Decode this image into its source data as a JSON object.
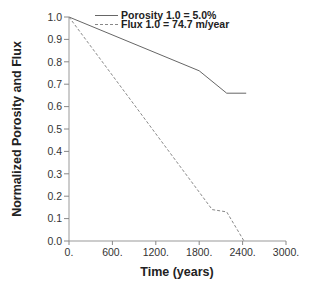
{
  "chart_data": {
    "type": "line",
    "title": "",
    "xlabel": "Time (years)",
    "ylabel": "Normalized Porosity and Flux",
    "xlim": [
      0,
      3000
    ],
    "ylim": [
      0.0,
      1.0
    ],
    "x_ticks": [
      "0.",
      "600.",
      "1200.",
      "1800.",
      "2400.",
      "3000."
    ],
    "y_ticks": [
      "0.0",
      "0.1",
      "0.2",
      "0.3",
      "0.4",
      "0.5",
      "0.6",
      "0.7",
      "0.8",
      "0.9",
      "1.0"
    ],
    "grid": false,
    "legend_position": "upper right",
    "series": [
      {
        "name": "Porosity 1.0 = 5.0%",
        "style": "solid",
        "x": [
          0,
          1800,
          2180,
          2450
        ],
        "y": [
          1.0,
          0.76,
          0.66,
          0.66
        ]
      },
      {
        "name": "Flux 1.0 = 74.7 m/year",
        "style": "dashed",
        "x": [
          0,
          1980,
          2180,
          2420
        ],
        "y": [
          1.0,
          0.14,
          0.13,
          0.0
        ]
      }
    ]
  }
}
